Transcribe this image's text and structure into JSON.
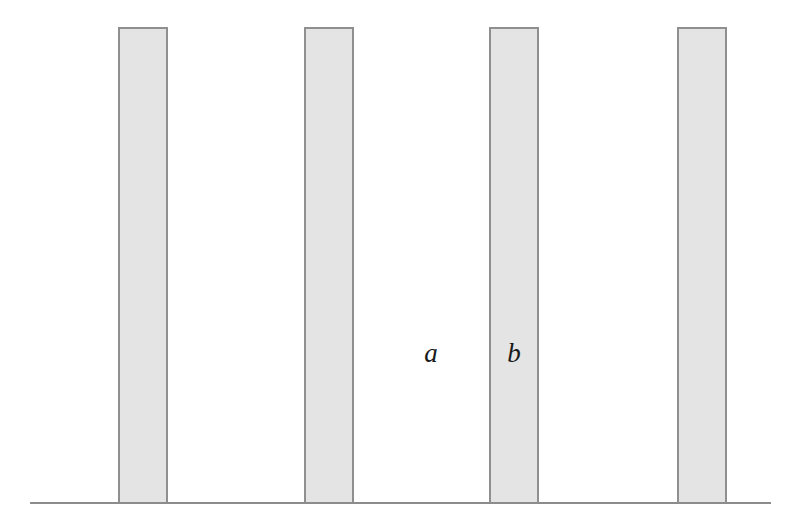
{
  "figure": {
    "canvas": {
      "width": 803,
      "height": 528
    },
    "background_color": "#ffffff"
  },
  "style": {
    "bar_fill_color": "#e4e4e4",
    "bar_stroke_color": "#8f8f8f",
    "bar_stroke_width": 1.6,
    "baseline_color": "#8c8c8c",
    "baseline_width": 2,
    "label_color": "#1a1a1a",
    "label_font_size": 27
  },
  "baseline": {
    "name": "baseline",
    "x_start": 30,
    "x_end": 771,
    "y": 503
  },
  "geometry": {
    "bar_width": 48,
    "gap_width": 138,
    "period": 186,
    "bar_top_y": 28,
    "bar_bottom_y": 503,
    "bar_height": 475,
    "bar_count": 4
  },
  "bars": [
    {
      "index": 1,
      "x": 119,
      "y": 28,
      "width": 48,
      "height": 475
    },
    {
      "index": 2,
      "x": 305,
      "y": 28,
      "width": 48,
      "height": 475
    },
    {
      "index": 3,
      "x": 490,
      "y": 28,
      "width": 48,
      "height": 475
    },
    {
      "index": 4,
      "x": 678,
      "y": 28,
      "width": 48,
      "height": 475
    }
  ],
  "labels": [
    {
      "id": "a",
      "text": "a",
      "x": 431,
      "y": 362,
      "meaning": "gap-width-label"
    },
    {
      "id": "b",
      "text": "b",
      "x": 514,
      "y": 362,
      "meaning": "barrier-width-label"
    }
  ],
  "chart_data": {
    "type": "bar",
    "xlabel": "",
    "ylabel": "",
    "categories": [
      "1",
      "2",
      "3",
      "4"
    ],
    "values": [
      475,
      475,
      475,
      475
    ],
    "x": [
      119,
      305,
      490,
      678
    ],
    "bar_width": 48,
    "period": 186,
    "grid": false,
    "legend": null,
    "annotations": [
      {
        "text": "a",
        "x": 431,
        "y": 352,
        "note": "width of gap between barriers"
      },
      {
        "text": "b",
        "x": 514,
        "y": 352,
        "note": "width of barrier"
      }
    ],
    "axis_ranges": {
      "xlim": [
        0,
        803
      ],
      "ylim": [
        0,
        528
      ]
    }
  }
}
